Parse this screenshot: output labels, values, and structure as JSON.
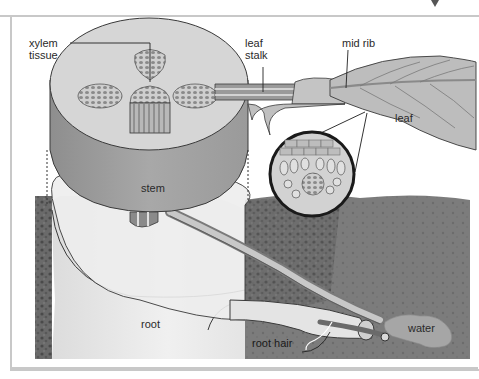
{
  "diagram": {
    "labels": {
      "xylem_line1": "xylem",
      "xylem_line2": "tissue",
      "leaf_stalk_line1": "leaf",
      "leaf_stalk_line2": "stalk",
      "mid_rib": "mid rib",
      "leaf": "leaf",
      "stem": "stem",
      "root": "root",
      "root_hair": "root hair",
      "water": "water"
    },
    "components": [
      {
        "id": "stem-cross-section",
        "label": "stem"
      },
      {
        "id": "xylem-bundles",
        "label": "xylem tissue",
        "count": 4
      },
      {
        "id": "leaf-stalk",
        "label": "leaf stalk"
      },
      {
        "id": "mid-rib",
        "label": "mid rib"
      },
      {
        "id": "leaf-blade",
        "label": "leaf"
      },
      {
        "id": "leaf-magnified-section",
        "label": ""
      },
      {
        "id": "root",
        "label": "root"
      },
      {
        "id": "root-hair",
        "label": "root hair"
      },
      {
        "id": "soil",
        "label": ""
      },
      {
        "id": "water-droplet",
        "label": "water"
      }
    ],
    "colors": {
      "stem_top": "#d9d9d9",
      "stem_side": "#9e9e9e",
      "root_body": "#ececec",
      "soil": "#6e6e6e",
      "soil_dark": "#4a4a4a",
      "leaf": "#b9b9b9",
      "water": "#a8a8a8",
      "frame": "#c8c8c8",
      "outline": "#3a3a3a"
    }
  }
}
